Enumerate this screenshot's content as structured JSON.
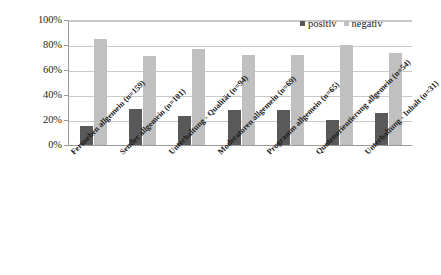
{
  "chart_data": {
    "type": "bar",
    "title": "",
    "subtitle": "",
    "xlabel": "",
    "ylabel": "",
    "ylim": [
      0,
      100
    ],
    "yticks": [
      "0%",
      "20%",
      "40%",
      "60%",
      "80%",
      "100%"
    ],
    "ytick_values": [
      0,
      20,
      40,
      60,
      80,
      100
    ],
    "grid": true,
    "legend_position": "top-right",
    "categories": [
      "Fernsehen allgemein (n=159)",
      "Sender allgemein (n=101)",
      "Unterhaltung - Qualität (n=94)",
      "Moderatoren allgemein (n=69)",
      "Programm allgemein (n=65)",
      "Quotenorientierung allgemein (n=54)",
      "Unterhaltung - Inhalt (n=31)"
    ],
    "series": [
      {
        "name": "positiv",
        "color": "#595959",
        "values": [
          15,
          29,
          23,
          28,
          28,
          20,
          26
        ]
      },
      {
        "name": "negativ",
        "color": "#c0c0c0",
        "values": [
          85,
          71,
          77,
          72,
          72,
          80,
          74
        ]
      }
    ]
  },
  "legend": {
    "items": [
      {
        "label": "positiv",
        "swatch": "positiv"
      },
      {
        "label": "negativ",
        "swatch": "negativ"
      }
    ]
  }
}
